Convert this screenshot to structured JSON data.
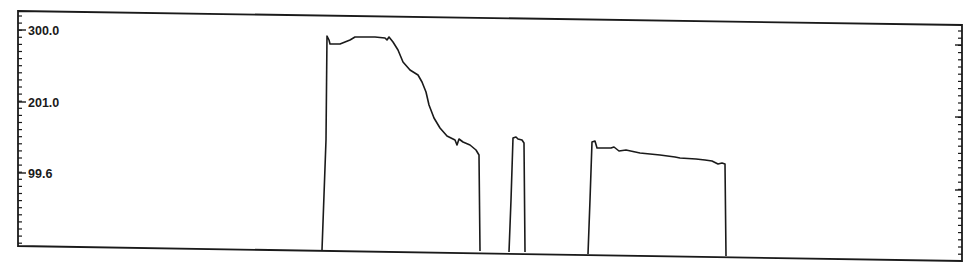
{
  "chart_data": {
    "type": "line",
    "title": "",
    "xlabel": "",
    "ylabel": "",
    "y_ticks": [
      "300.0",
      "201.0",
      "99.6"
    ],
    "y_tick_values": [
      300.0,
      201.0,
      99.6
    ],
    "ylim": [
      0,
      330
    ],
    "grid": false,
    "legend": null,
    "series": [
      {
        "name": "trace",
        "color": "#1a1a1a",
        "description": "Trace with three pulses: a tall decaying pulse, a narrow spike, and a flat slowly declining plateau",
        "segments": [
          {
            "label": "pulse-1",
            "x_start_frac": 0.32,
            "x_end_frac": 0.49,
            "peak": 297,
            "end_level": 128
          },
          {
            "label": "pulse-2",
            "x_start_frac": 0.52,
            "x_end_frac": 0.535,
            "peak": 153,
            "end_level": 148
          },
          {
            "label": "pulse-3",
            "x_start_frac": 0.6,
            "x_end_frac": 0.74,
            "peak": 148,
            "end_level": 126
          }
        ]
      }
    ],
    "colors": {
      "line": "#1a1a1a",
      "frame": "#1a1a1a",
      "background": "#ffffff"
    }
  }
}
